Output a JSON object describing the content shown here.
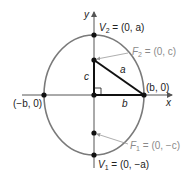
{
  "figure": {
    "top_text_cut": "",
    "colors": {
      "ellipse": "#7a7a7a",
      "axes": "#555555",
      "triangle": "#111111",
      "points": "#111111",
      "leader": "#999999",
      "focus_labels": "#8a8a8a",
      "text": "#222222"
    },
    "axes": {
      "x_label": "x",
      "y_label": "y"
    },
    "points": {
      "V2": {
        "name": "V",
        "sub": "2",
        "rest": " = (0, a)"
      },
      "V1": {
        "name": "V",
        "sub": "1",
        "rest": " = (0, −a)"
      },
      "F2": {
        "name": "F",
        "sub": "2",
        "rest": " = (0, c)"
      },
      "F1": {
        "name": "F",
        "sub": "1",
        "rest": " = (0, −c)"
      },
      "right_vertex": "(b, 0)",
      "left_vertex": "(−b, 0)"
    },
    "triangle_sides": {
      "vertical": "c",
      "hypotenuse": "a",
      "horizontal": "b"
    }
  }
}
